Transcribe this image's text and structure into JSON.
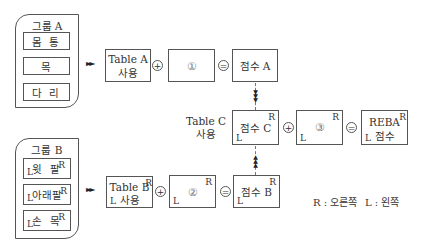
{
  "group_a": {
    "title": "그룹 A",
    "items": [
      "몸 통",
      "목",
      "다 리"
    ]
  },
  "group_b": {
    "title": "그룹 B",
    "items": [
      "윗 팔",
      "아래팔",
      "손 목"
    ],
    "side_right": "R",
    "side_left": "L"
  },
  "table_a": {
    "line1": "Table A",
    "line2": "사용"
  },
  "table_b": {
    "line1": "Table B",
    "line2": "사용",
    "sup": "R",
    "sub": "L"
  },
  "table_c_label": {
    "line1": "Table C",
    "line2": "사용"
  },
  "box_1": {
    "label": "①"
  },
  "box_2": {
    "label": "②",
    "sup": "R",
    "sub": "L"
  },
  "box_3": {
    "label": "③",
    "sup": "R",
    "sub": "L"
  },
  "score_a": {
    "label": "점수 A"
  },
  "score_b": {
    "label": "점수 B",
    "sup": "R",
    "sub": "L"
  },
  "score_c": {
    "label": "점수 C",
    "sup": "R",
    "sub": "L"
  },
  "reba": {
    "line1": "REBA",
    "line2": "점수",
    "sup": "R",
    "sub": "L"
  },
  "operators": {
    "plus": "+",
    "equals": "="
  },
  "arrows": {
    "right": "►►",
    "down": "▼",
    "up": "▲"
  },
  "legend": {
    "right": "R : 오른쪽",
    "left": "L : 왼쪽"
  }
}
